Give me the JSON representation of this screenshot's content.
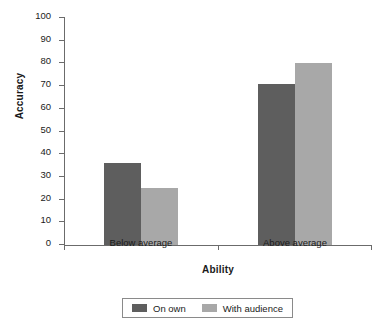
{
  "chart_data": {
    "type": "bar",
    "title": "",
    "xlabel": "Ability",
    "ylabel": "Accuracy",
    "categories": [
      "Below average",
      "Above average"
    ],
    "series": [
      {
        "name": "On own",
        "color": "#5e5e5e",
        "values": [
          36,
          71
        ]
      },
      {
        "name": "With audience",
        "color": "#a8a8a8",
        "values": [
          25,
          80
        ]
      }
    ],
    "ylim": [
      0,
      100
    ],
    "yticks": [
      0,
      10,
      20,
      30,
      40,
      50,
      60,
      70,
      80,
      90,
      100
    ],
    "ytick_labels": [
      "0",
      "10",
      "20",
      "30",
      "40",
      "50",
      "60",
      "70",
      "80",
      "90",
      "100"
    ],
    "grid": false,
    "legend_position": "bottom-center"
  },
  "legend": {
    "items": [
      {
        "label": "On own",
        "color": "#5e5e5e"
      },
      {
        "label": "With audience",
        "color": "#a8a8a8"
      }
    ]
  },
  "axes": {
    "x_title": "Ability",
    "y_title": "Accuracy",
    "x_categories": [
      "Below average",
      "Above average"
    ]
  }
}
